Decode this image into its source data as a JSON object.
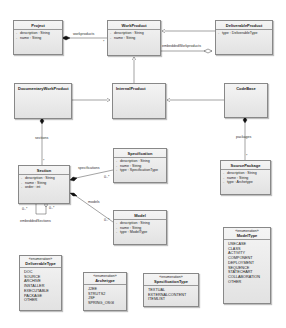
{
  "diagram": {
    "type": "UML class diagram",
    "classes": {
      "project": {
        "name": "Project",
        "attributes": [
          {
            "vis": "-",
            "text": "description : String"
          },
          {
            "vis": "-",
            "text": "name : String"
          }
        ]
      },
      "workproduct": {
        "name": "WorkProduct",
        "attributes": [
          {
            "vis": "-",
            "text": "description : String"
          },
          {
            "vis": "-",
            "text": "name : String"
          }
        ]
      },
      "deliverableproduct": {
        "name": "DeliverableProduct",
        "attributes": [
          {
            "vis": "-",
            "text": "type : DeliverableType"
          }
        ]
      },
      "documentaryworkproduct": {
        "name": "DocumentaryWorkProduct"
      },
      "internalproduct": {
        "name": "InternalProduct"
      },
      "codebase": {
        "name": "CodeBase"
      },
      "section": {
        "name": "Section",
        "attributes": [
          {
            "vis": "-",
            "text": "description : String"
          },
          {
            "vis": "-",
            "text": "name : String"
          },
          {
            "vis": "-",
            "text": "order : int"
          }
        ]
      },
      "specification": {
        "name": "Specification",
        "attributes": [
          {
            "vis": "-",
            "text": "description : String"
          },
          {
            "vis": "-",
            "text": "name : String"
          },
          {
            "vis": "-",
            "text": "type : SpecificationType"
          }
        ]
      },
      "model": {
        "name": "Model",
        "attributes": [
          {
            "vis": "-",
            "text": "description : String"
          },
          {
            "vis": "-",
            "text": "name : String"
          },
          {
            "vis": "-",
            "text": "type : ModelType"
          }
        ]
      },
      "sourcepackage": {
        "name": "SourcePackage",
        "attributes": [
          {
            "vis": "-",
            "text": "description : String"
          },
          {
            "vis": "-",
            "text": "name : String"
          },
          {
            "vis": "-",
            "text": "type : Archetype"
          }
        ]
      }
    },
    "enumerations": {
      "stereotype": "«enumeration»",
      "deliverabletype": {
        "name": "DeliverableType",
        "literals": [
          "DOC",
          "SOURCE",
          "ARCHIVE",
          "INSTALLER",
          "EXECUTABLE",
          "PACKAGE",
          "OTHER"
        ]
      },
      "archetype": {
        "name": "Archetype",
        "literals": [
          "J2EE",
          "STRUTS2",
          "JSF",
          "SPRING_OSGI"
        ]
      },
      "specificationtype": {
        "name": "SpecificationType",
        "literals": [
          "TEXTUAL",
          "EXTERNALCONTENT",
          "ITEMLIST"
        ]
      },
      "modeltype": {
        "name": "ModelType",
        "literals": [
          "USECASE",
          "CLASS",
          "ACTIVITY",
          "COMPONENT",
          "DEPLOYMENT",
          "SEQUENCE",
          "STATECHART",
          "COLLABORATION",
          "OTHER"
        ]
      }
    },
    "associations": {
      "workproducts": "workproducts",
      "embeddedWorkproducts": "embeddedWorkproducts",
      "sections": "sections",
      "packages": "packages",
      "specifications": "specifications",
      "models": "models",
      "embeddedSections": "embeddedSections"
    },
    "multiplicities": {
      "many": "0..*",
      "star": "*"
    }
  }
}
